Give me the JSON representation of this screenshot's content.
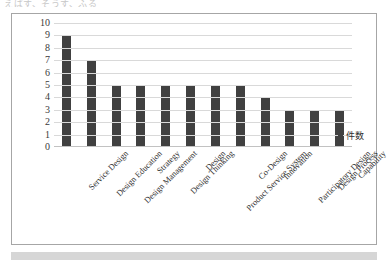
{
  "top_caption": "えばす、そうす、ふる",
  "chart_data": {
    "type": "bar",
    "title": "",
    "xlabel": "",
    "ylabel": "",
    "ylim": [
      0,
      10
    ],
    "yticks": [
      10,
      9,
      8,
      7,
      6,
      5,
      4,
      3,
      2,
      1,
      0
    ],
    "grid": true,
    "legend_position": "right",
    "categories": [
      "Service Design",
      "Design Education",
      "Design Management",
      "Strategy",
      "Design Thinking",
      "Design",
      "Product Service System",
      "Co-Design",
      "Innovation",
      "Participatory Design",
      "Design Process",
      "Capability"
    ],
    "series": [
      {
        "name": "件数",
        "values": [
          9,
          7,
          5,
          5,
          5,
          5,
          5,
          5,
          4,
          3,
          3,
          3
        ],
        "color": "#404040"
      }
    ]
  },
  "legend": {
    "label": "件数"
  },
  "colors": {
    "bar": "#404040",
    "gridline": "#d9d9d9",
    "frame_border": "#a6a6a6",
    "bottom_bar": "#d6d6d6"
  }
}
